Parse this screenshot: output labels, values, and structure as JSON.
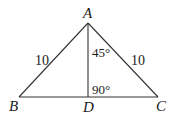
{
  "diagram": {
    "type": "geometry-triangle",
    "points": {
      "A": {
        "label": "A",
        "x": 88,
        "y": 23
      },
      "B": {
        "label": "B",
        "x": 19,
        "y": 97
      },
      "C": {
        "label": "C",
        "x": 158,
        "y": 97
      },
      "D": {
        "label": "D",
        "x": 88,
        "y": 97
      }
    },
    "segments": [
      {
        "from": "A",
        "to": "B",
        "label": "10"
      },
      {
        "from": "A",
        "to": "C",
        "label": "10"
      },
      {
        "from": "B",
        "to": "C",
        "label": ""
      },
      {
        "from": "A",
        "to": "D",
        "label": ""
      }
    ],
    "angles": {
      "BAD_or_DAC": "45°",
      "ADC": "90°"
    },
    "labels": {
      "side_AB": "10",
      "side_AC": "10",
      "angle_at_A": "45°",
      "angle_at_D": "90°"
    },
    "colors": {
      "stroke": "#333333",
      "text": "#1a1a1a",
      "background": "#ffffff"
    }
  }
}
